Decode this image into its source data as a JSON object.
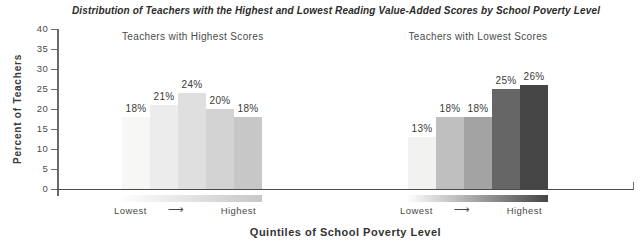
{
  "title": "Distribution of Teachers with the Highest and Lowest Reading Value-Added Scores by School Poverty Level",
  "y_axis": {
    "label": "Percent of Teachers"
  },
  "x_axis": {
    "label": "Quintiles of School Poverty Level"
  },
  "icons": {
    "right_arrow": "⟶"
  },
  "colors": {
    "axis": "#4a4a4a",
    "label_text": "#3a3a3a",
    "background": "#ffffff"
  },
  "chart_data": {
    "type": "bar",
    "title": "Distribution of Teachers with the Highest and Lowest Reading Value-Added Scores by School Poverty Level",
    "ylabel": "Percent of Teachers",
    "xlabel": "Quintiles of School Poverty Level",
    "ylim": [
      0,
      40
    ],
    "yticks": [
      0,
      5,
      10,
      15,
      20,
      25,
      30,
      35,
      40
    ],
    "grid": false,
    "legend": false,
    "groups": [
      {
        "label": "Teachers with Highest Scores",
        "axis_start_label": "Lowest",
        "axis_end_label": "Highest",
        "values": [
          18,
          21,
          24,
          20,
          18
        ],
        "value_labels": [
          "18%",
          "21%",
          "24%",
          "20%",
          "18%"
        ],
        "bar_colors": [
          "#f7f7f6",
          "#ececec",
          "#dfdfdf",
          "#d3d3d3",
          "#c7c7c7"
        ],
        "gradient_strip": [
          "#fdfdfd",
          "#c7c7c7"
        ]
      },
      {
        "label": "Teachers with Lowest Scores",
        "axis_start_label": "Lowest",
        "axis_end_label": "Highest",
        "values": [
          13,
          18,
          18,
          25,
          26
        ],
        "value_labels": [
          "13%",
          "18%",
          "18%",
          "25%",
          "26%"
        ],
        "bar_colors": [
          "#f2f2f1",
          "#bfbfbf",
          "#a3a3a3",
          "#666666",
          "#454545"
        ],
        "gradient_strip": [
          "#fdfdfd",
          "#454545"
        ]
      }
    ]
  }
}
